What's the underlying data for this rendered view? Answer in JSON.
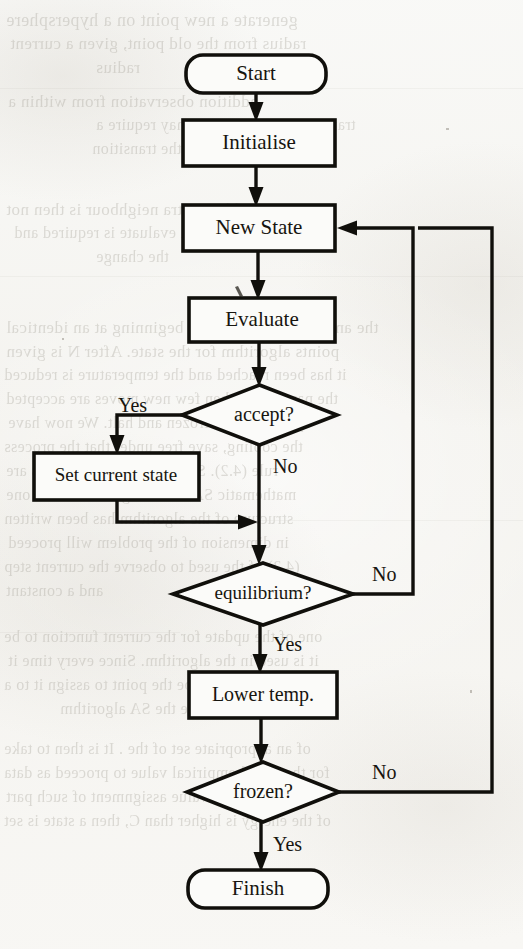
{
  "figure": {
    "kind": "flowchart",
    "medium": "scanned-book-page",
    "ink_color": "#100f0b",
    "paper_color": "#f7f7f4",
    "ghost_text_color": "#9a968c"
  },
  "nodes": [
    {
      "id": "start",
      "label": "Start",
      "shape": "rounded-rectangle",
      "x": 186,
      "y": 55,
      "w": 140,
      "h": 38
    },
    {
      "id": "init",
      "label": "Initialise",
      "shape": "rectangle",
      "x": 183,
      "y": 120,
      "w": 152,
      "h": 46
    },
    {
      "id": "newstate",
      "label": "New State",
      "shape": "rectangle",
      "x": 183,
      "y": 205,
      "w": 152,
      "h": 46
    },
    {
      "id": "evaluate",
      "label": "Evaluate",
      "shape": "rectangle",
      "x": 189,
      "y": 298,
      "w": 146,
      "h": 44
    },
    {
      "id": "accept",
      "label": "accept?",
      "shape": "diamond",
      "x": 182,
      "y": 385,
      "w": 155,
      "h": 60
    },
    {
      "id": "setcur",
      "label": "Set current state",
      "shape": "rectangle",
      "x": 34,
      "y": 453,
      "w": 165,
      "h": 47
    },
    {
      "id": "equil",
      "label": "equilibrium?",
      "shape": "diamond",
      "x": 173,
      "y": 563,
      "w": 180,
      "h": 62
    },
    {
      "id": "lowertemp",
      "label": "Lower temp.",
      "shape": "rectangle",
      "x": 189,
      "y": 672,
      "w": 148,
      "h": 46
    },
    {
      "id": "frozen",
      "label": "frozen?",
      "shape": "diamond",
      "x": 187,
      "y": 762,
      "w": 152,
      "h": 60
    },
    {
      "id": "finish",
      "label": "Finish",
      "shape": "rounded-rectangle",
      "x": 188,
      "y": 870,
      "w": 140,
      "h": 38
    }
  ],
  "edges": [
    {
      "from": "start",
      "to": "init",
      "label": ""
    },
    {
      "from": "init",
      "to": "newstate",
      "label": ""
    },
    {
      "from": "newstate",
      "to": "evaluate",
      "label": ""
    },
    {
      "from": "evaluate",
      "to": "accept",
      "label": ""
    },
    {
      "from": "accept",
      "to": "setcur",
      "label": "Yes"
    },
    {
      "from": "accept",
      "to": "equil",
      "label": "No"
    },
    {
      "from": "setcur",
      "to": "equil",
      "label": ""
    },
    {
      "from": "equil",
      "to": "newstate",
      "label": "No"
    },
    {
      "from": "equil",
      "to": "lowertemp",
      "label": "Yes"
    },
    {
      "from": "lowertemp",
      "to": "frozen",
      "label": ""
    },
    {
      "from": "frozen",
      "to": "newstate",
      "label": "No"
    },
    {
      "from": "frozen",
      "to": "finish",
      "label": "Yes"
    }
  ],
  "branch_labels": [
    {
      "id": "accept-yes",
      "text": "Yes",
      "x": 118,
      "y": 407
    },
    {
      "id": "accept-no",
      "text": "No",
      "x": 273,
      "y": 468
    },
    {
      "id": "equil-no",
      "text": "No",
      "x": 372,
      "y": 576
    },
    {
      "id": "equil-yes",
      "text": "Yes",
      "x": 273,
      "y": 646
    },
    {
      "id": "frozen-no",
      "text": "No",
      "x": 372,
      "y": 774
    },
    {
      "id": "frozen-yes",
      "text": "Yes",
      "x": 273,
      "y": 846
    }
  ],
  "ghost_text": {
    "note": "Faint show-through text from the reverse side of the scanned page",
    "mirrored_lines": [
      {
        "text": "generate a new point on a hypersphere",
        "x": 6,
        "y": 10,
        "size": 18
      },
      {
        "text": "radius from the old point, given a current",
        "x": 10,
        "y": 34,
        "size": 17
      },
      {
        "text": "radius",
        "x": 96,
        "y": 58,
        "size": 17
      },
      {
        "text": "addition observation from within a",
        "x": 8,
        "y": 92,
        "size": 17
      },
      {
        "text": "transition to a new state may require a",
        "x": 96,
        "y": 116,
        "size": 16
      },
      {
        "text": "the transition",
        "x": 92,
        "y": 140,
        "size": 16
      },
      {
        "text": "add an extra neighbour is then not",
        "x": 6,
        "y": 200,
        "size": 17
      },
      {
        "text": "we should evaluate is required and",
        "x": 14,
        "y": 224,
        "size": 16
      },
      {
        "text": "the change",
        "x": 96,
        "y": 248,
        "size": 16
      },
      {
        "text": "the annealing schedule the beginning at an identical",
        "x": 6,
        "y": 318,
        "size": 17
      },
      {
        "text": "points algorithm for the state. After N is given",
        "x": 6,
        "y": 342,
        "size": 17
      },
      {
        "text": "it has been reached and the temperature is reduced",
        "x": 4,
        "y": 366,
        "size": 16
      },
      {
        "text": "the parameter when few new moves are accepted",
        "x": 6,
        "y": 390,
        "size": 16
      },
      {
        "text": "system is then frozen and halt. We now have",
        "x": 8,
        "y": 414,
        "size": 16
      },
      {
        "text": "the cooling, save free under that the process",
        "x": 4,
        "y": 438,
        "size": 16
      },
      {
        "text": "rule (4.2).  Some proposed schedules are",
        "x": 6,
        "y": 462,
        "size": 16
      },
      {
        "text": "mathematic SA that using the standard one",
        "x": 6,
        "y": 486,
        "size": 16
      },
      {
        "text": "structure of the algorithm has been written",
        "x": 4,
        "y": 510,
        "size": 16
      },
      {
        "text": "in dimension of the problem will proceed",
        "x": 8,
        "y": 534,
        "size": 16
      },
      {
        "text": "(4.2) of the used to observe the current step",
        "x": 4,
        "y": 558,
        "size": 16
      },
      {
        "text": "and a constant",
        "x": 6,
        "y": 582,
        "size": 16
      },
      {
        "text": "one of the update for the current function to be",
        "x": 4,
        "y": 628,
        "size": 16
      },
      {
        "text": "it is used in the algorithm. Since every time it",
        "x": 8,
        "y": 652,
        "size": 16
      },
      {
        "text": "and should be the point to assign it to a",
        "x": 4,
        "y": 676,
        "size": 16
      },
      {
        "text": "characterise the SA algorithm",
        "x": 60,
        "y": 700,
        "size": 16
      },
      {
        "text": "of an appropriate set of the  . It is then to take",
        "x": 4,
        "y": 740,
        "size": 16
      },
      {
        "text": "for the initial empirical value to proceed as data",
        "x": 4,
        "y": 764,
        "size": 16
      },
      {
        "text": "we view the the value assignment of such part",
        "x": 6,
        "y": 788,
        "size": 16
      },
      {
        "text": "of the energy is higher than C, then a state is set",
        "x": 4,
        "y": 812,
        "size": 16
      }
    ],
    "rules": [
      {
        "x": 0,
        "y": 88,
        "w": 523
      },
      {
        "x": 0,
        "y": 276,
        "w": 523
      },
      {
        "x": 250,
        "y": 520,
        "w": 273
      },
      {
        "x": 0,
        "y": 632,
        "w": 180
      }
    ]
  }
}
